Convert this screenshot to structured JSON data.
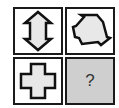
{
  "puzzle": {
    "cells": [
      {
        "shape": "vertical-arrow-hexagon-icon"
      },
      {
        "shape": "rotated-arrow-hexagon-icon"
      },
      {
        "shape": "cross-icon"
      },
      {
        "shape": "question-placeholder",
        "label": "?"
      }
    ],
    "colors": {
      "border": "#1a1a1a",
      "shape_fill": "#e8e8e8",
      "unknown_cell_bg": "#cfcfcf"
    }
  }
}
